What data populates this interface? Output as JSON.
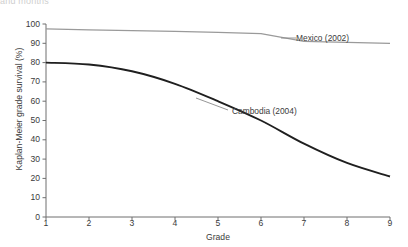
{
  "partial_top_text": "and months",
  "chart_data": {
    "type": "line",
    "title": "",
    "xlabel": "Grade",
    "ylabel": "Kaplan-Meier grade survival (%)",
    "x": [
      1,
      2,
      3,
      4,
      5,
      6,
      7,
      8,
      9
    ],
    "xlim": [
      1,
      9
    ],
    "ylim": [
      0,
      100
    ],
    "xticks": [
      "1",
      "2",
      "3",
      "4",
      "5",
      "6",
      "7",
      "8",
      "9"
    ],
    "yticks": [
      "0",
      "10",
      "20",
      "30",
      "40",
      "50",
      "60",
      "70",
      "80",
      "90",
      "100"
    ],
    "grid": false,
    "legend_position": "inline-annotation",
    "series": [
      {
        "name": "Mexico (2002)",
        "color": "#9a9a9a",
        "values": [
          97.5,
          97.0,
          96.6,
          96.2,
          95.7,
          95.0,
          91.0,
          90.5,
          90.0
        ]
      },
      {
        "name": "Cambodia (2004)",
        "color": "#1f1f1f",
        "values": [
          80.0,
          79.0,
          75.5,
          69.0,
          60.0,
          50.0,
          38.0,
          28.0,
          21.0
        ]
      }
    ]
  },
  "annotations": [
    {
      "text": "Mexico (2002)",
      "series": "Mexico (2002)"
    },
    {
      "text": "Cambodia (2004)",
      "series": "Cambodia (2004)"
    }
  ]
}
